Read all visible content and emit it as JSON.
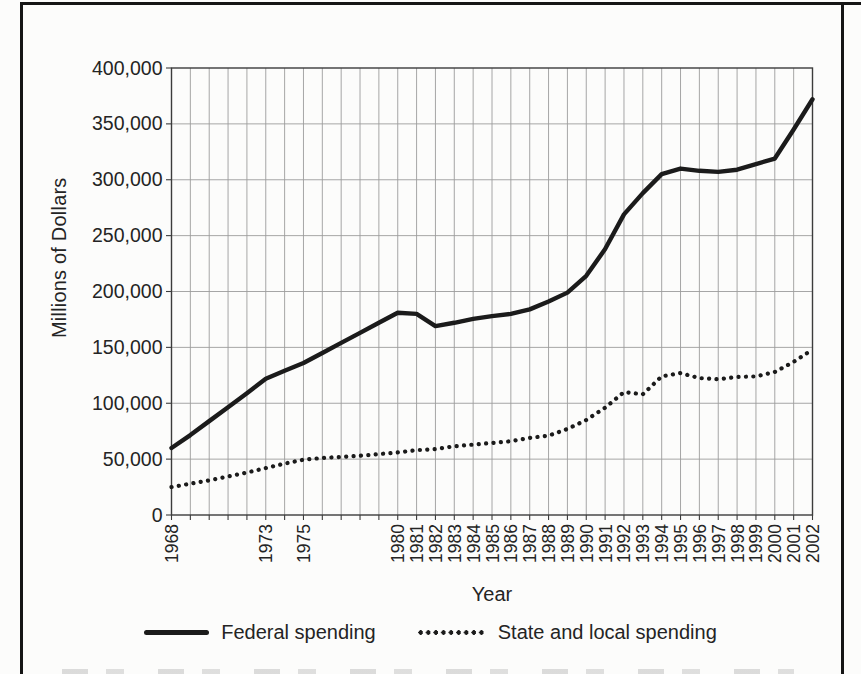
{
  "page": {
    "frame_color": "#151515",
    "background": "#fcfcfb"
  },
  "chart_data": {
    "type": "line",
    "title": "",
    "x_axis_title": "Year",
    "y_axis_title": "Millions of Dollars",
    "ylim": [
      0,
      400000
    ],
    "grid": true,
    "legend_position": "bottom",
    "grid_color": "#9c9c9c",
    "axis_color": "#3c3c3c",
    "text_color": "#242424",
    "x": [
      1968,
      1969,
      1970,
      1971,
      1972,
      1973,
      1974,
      1975,
      1976,
      1977,
      1978,
      1979,
      1980,
      1981,
      1982,
      1983,
      1984,
      1985,
      1986,
      1987,
      1988,
      1989,
      1990,
      1991,
      1992,
      1993,
      1994,
      1995,
      1996,
      1997,
      1998,
      1999,
      2000,
      2001,
      2002
    ],
    "x_tick_labels": [
      "1968",
      "1973",
      "1975",
      "1980",
      "1981",
      "1982",
      "1983",
      "1984",
      "1985",
      "1986",
      "1987",
      "1988",
      "1989",
      "1990",
      "1991",
      "1992",
      "1993",
      "1994",
      "1995",
      "1996",
      "1997",
      "1998",
      "1999",
      "2000",
      "2001",
      "2002"
    ],
    "y_ticks": [
      {
        "value": 0,
        "label": "0"
      },
      {
        "value": 50000,
        "label": "50,000"
      },
      {
        "value": 100000,
        "label": "100,000"
      },
      {
        "value": 150000,
        "label": "150,000"
      },
      {
        "value": 200000,
        "label": "200,000"
      },
      {
        "value": 250000,
        "label": "250,000"
      },
      {
        "value": 300000,
        "label": "300,000"
      },
      {
        "value": 350000,
        "label": "350,000"
      },
      {
        "value": 400000,
        "label": "400,000"
      }
    ],
    "series": [
      {
        "name": "Federal spending",
        "style": "solid",
        "color": "#1b1b1b",
        "values": [
          60000,
          71500,
          84000,
          96500,
          109000,
          122000,
          129000,
          136000,
          145000,
          154000,
          163000,
          172000,
          181000,
          180000,
          169000,
          172000,
          175500,
          178000,
          180000,
          184000,
          191000,
          199000,
          214000,
          238000,
          269000,
          288000,
          305000,
          310000,
          308000,
          307000,
          309000,
          314000,
          319000,
          345000,
          372000
        ]
      },
      {
        "name": "State and local spending",
        "style": "dotted",
        "color": "#1b1b1b",
        "values": [
          25000,
          28000,
          31000,
          34500,
          38000,
          42000,
          46000,
          49500,
          51000,
          52000,
          53000,
          54500,
          56000,
          58000,
          59000,
          61500,
          63000,
          64500,
          66000,
          69000,
          71000,
          77000,
          85000,
          96000,
          110000,
          108000,
          124000,
          127000,
          122500,
          121500,
          123500,
          124000,
          128000,
          137000,
          148000
        ]
      }
    ]
  }
}
